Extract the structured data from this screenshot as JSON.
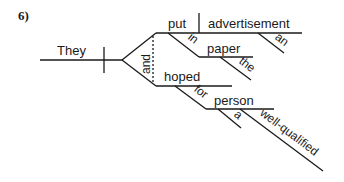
{
  "problem_number": "6)",
  "diagram": {
    "subject": "They",
    "conjunction": "and",
    "upper_predicate": {
      "verb": "put",
      "direct_object": "advertisement",
      "object_modifier": "an",
      "preposition": "in",
      "prep_object": "paper",
      "prep_object_modifier": "the"
    },
    "lower_predicate": {
      "verb": "hoped",
      "preposition": "for",
      "prep_object": "person",
      "modifiers": [
        "a",
        "well-qualified"
      ]
    }
  },
  "colors": {
    "line": "#1a1a1a",
    "background": "#ffffff"
  }
}
